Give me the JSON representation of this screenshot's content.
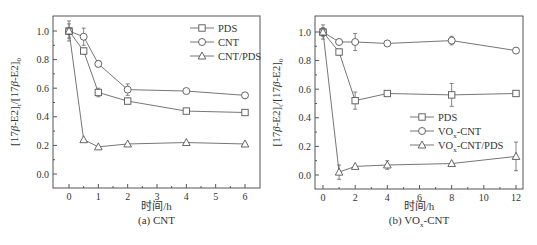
{
  "chart_data": [
    {
      "type": "line",
      "title": "(a) CNT",
      "xlabel": "时间/h",
      "ylabel": "[17β-E2]t/[17β-E2]0",
      "xlim": [
        -0.5,
        6.4
      ],
      "ylim": [
        -0.1,
        1.1
      ],
      "xticks": [
        0,
        1,
        2,
        3,
        4,
        5,
        6
      ],
      "yticks": [
        0.0,
        0.2,
        0.4,
        0.6,
        0.8,
        1.0
      ],
      "yticklabels": [
        "0.0",
        "0.2",
        "0.4",
        "0.6",
        "0.8",
        "1.0"
      ],
      "legend_position": "top-right",
      "series": [
        {
          "name": "PDS",
          "marker": "square",
          "x": [
            0,
            0.5,
            1,
            2,
            4,
            6
          ],
          "y": [
            1.0,
            0.86,
            0.57,
            0.51,
            0.44,
            0.43
          ],
          "err": [
            0.05,
            0.02,
            0.03,
            0.02,
            0.01,
            0.01
          ]
        },
        {
          "name": "CNT",
          "marker": "circle",
          "x": [
            0,
            0.5,
            1,
            2,
            4,
            6
          ],
          "y": [
            1.0,
            0.96,
            0.77,
            0.59,
            0.58,
            0.55
          ],
          "err": [
            0.07,
            0.06,
            0.02,
            0.04,
            0.01,
            0.02
          ]
        },
        {
          "name": "CNT/PDS",
          "marker": "triangle",
          "x": [
            0,
            0.5,
            1,
            2,
            4,
            6
          ],
          "y": [
            1.0,
            0.24,
            0.19,
            0.21,
            0.22,
            0.21
          ],
          "err": [
            0.02,
            0.01,
            0.01,
            0.01,
            0.01,
            0.01
          ]
        }
      ]
    },
    {
      "type": "line",
      "title": "(b) VOx-CNT",
      "xlabel": "时间/h",
      "ylabel": "[17β-E2]t/[17β-E2]0",
      "xlim": [
        -0.8,
        12.4
      ],
      "ylim": [
        -0.1,
        1.1
      ],
      "xticks": [
        0,
        2,
        4,
        6,
        8,
        10,
        12
      ],
      "yticks": [
        0.0,
        0.2,
        0.4,
        0.6,
        0.8,
        1.0
      ],
      "yticklabels": [
        "0.0",
        "0.2",
        "0.4",
        "0.6",
        "0.8",
        "1.0"
      ],
      "legend_position": "center-right",
      "series": [
        {
          "name": "PDS",
          "marker": "square",
          "x": [
            0,
            1,
            2,
            4,
            8,
            12
          ],
          "y": [
            1.0,
            0.86,
            0.52,
            0.57,
            0.56,
            0.57
          ],
          "err": [
            0.03,
            0.02,
            0.06,
            0.01,
            0.08,
            0.01
          ]
        },
        {
          "name": "VOx-CNT",
          "marker": "circle",
          "x": [
            0,
            1,
            2,
            4,
            8,
            12
          ],
          "y": [
            1.0,
            0.93,
            0.93,
            0.92,
            0.94,
            0.87
          ],
          "err": [
            0.05,
            0.01,
            0.06,
            0.01,
            0.03,
            0.02
          ]
        },
        {
          "name": "VOx-CNT/PDS",
          "marker": "triangle",
          "x": [
            0,
            1,
            2,
            4,
            8,
            12
          ],
          "y": [
            1.0,
            0.02,
            0.06,
            0.07,
            0.08,
            0.13
          ],
          "err": [
            0.02,
            0.05,
            0.01,
            0.03,
            0.01,
            0.1
          ]
        }
      ]
    }
  ],
  "panels": [
    {
      "caption": "(a) CNT",
      "xlabel": "时间/h",
      "legend": [
        "PDS",
        "CNT",
        "CNT/PDS"
      ]
    },
    {
      "caption_prefix": "(b) VO",
      "caption_sub": "x",
      "caption_suffix": "-CNT",
      "xlabel": "时间/h",
      "legend": [
        "PDS",
        "VO|x|-CNT",
        "VO|x|-CNT/PDS"
      ]
    }
  ],
  "ylabel_parts": {
    "a": "[17",
    "beta": "β",
    "b": "-E2]",
    "t": "t",
    "c": "/[17",
    "d": "-E2]",
    "zero": "0"
  }
}
